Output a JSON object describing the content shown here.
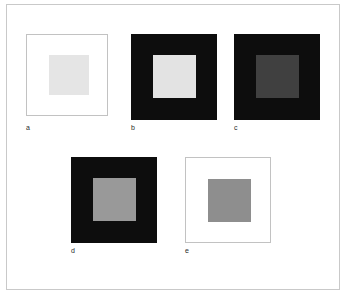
{
  "figure": {
    "frame_color": "#c9c9c9",
    "background_color": "#ffffff"
  },
  "panels": [
    {
      "id": "a",
      "label": "a",
      "surround_color": "#ffffff",
      "surround_border_color": "#c2c2c2",
      "target_color": "#e5e5e5",
      "x": 26,
      "y": 34,
      "size": 82,
      "inner_x": 22,
      "inner_y": 20,
      "inner_size": 40,
      "caption_x": 26,
      "caption_y": 124
    },
    {
      "id": "b",
      "label": "b",
      "surround_color": "#0d0d0d",
      "surround_border_color": "none",
      "target_color": "#e3e3e3",
      "x": 131,
      "y": 34,
      "size": 86,
      "inner_x": 22,
      "inner_y": 21,
      "inner_size": 43,
      "caption_x": 131,
      "caption_y": 124
    },
    {
      "id": "c",
      "label": "c",
      "surround_color": "#0d0d0d",
      "surround_border_color": "none",
      "target_color": "#404040",
      "x": 234,
      "y": 34,
      "size": 86,
      "inner_x": 22,
      "inner_y": 21,
      "inner_size": 43,
      "caption_x": 234,
      "caption_y": 124
    },
    {
      "id": "d",
      "label": "d",
      "surround_color": "#0d0d0d",
      "surround_border_color": "none",
      "target_color": "#999999",
      "x": 71,
      "y": 157,
      "size": 86,
      "inner_x": 22,
      "inner_y": 21,
      "inner_size": 43,
      "caption_x": 71,
      "caption_y": 247
    },
    {
      "id": "e",
      "label": "e",
      "surround_color": "#ffffff",
      "surround_border_color": "#c2c2c2",
      "target_color": "#8e8e8e",
      "x": 185,
      "y": 157,
      "size": 86,
      "inner_x": 22,
      "inner_y": 21,
      "inner_size": 43,
      "caption_x": 185,
      "caption_y": 247
    }
  ]
}
